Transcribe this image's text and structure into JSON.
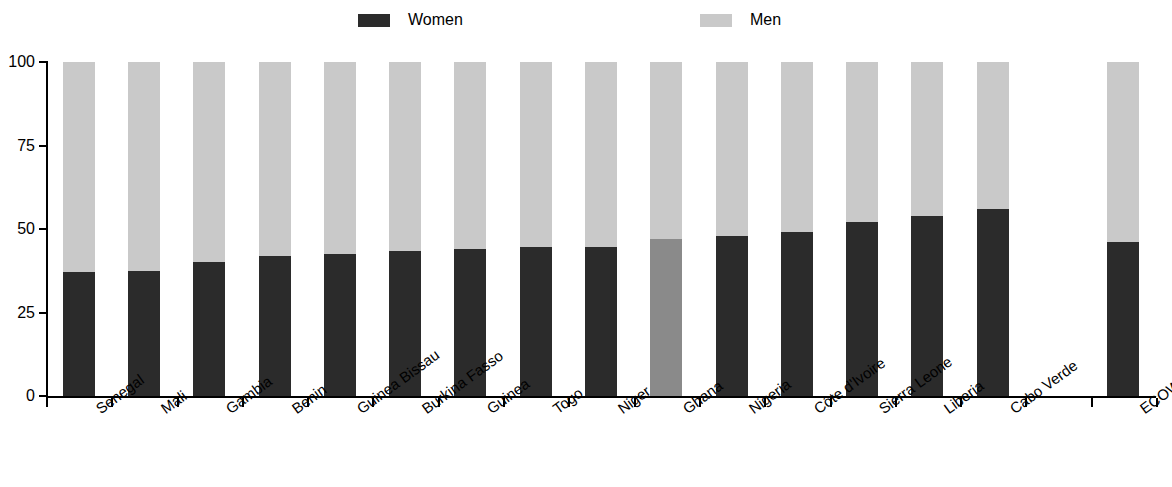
{
  "legend": {
    "items": [
      {
        "label": "Women",
        "color": "#2b2b2b"
      },
      {
        "label": "Men",
        "color": "#c9c9c9"
      }
    ]
  },
  "axis": {
    "y_ticks": [
      "0",
      "25",
      "50",
      "75",
      "100"
    ]
  },
  "chart_data": {
    "type": "bar",
    "subtype": "stacked-100-percent",
    "title": "",
    "subtitle": "",
    "xlabel": "",
    "ylabel": "",
    "ylim": [
      0,
      100
    ],
    "yticks": [
      0,
      25,
      50,
      75,
      100
    ],
    "grid": false,
    "legend_position": "top",
    "categories": [
      "Senegal",
      "Mali",
      "Gambia",
      "Benin",
      "Guinea Bissau",
      "Burkina Fasso",
      "Guinea",
      "Togo",
      "Niger",
      "Ghana",
      "Nigeria",
      "Côte d'Ivoire",
      "Sierra Leone",
      "Liberia",
      "Cabo Verde",
      "",
      "ECOWAS"
    ],
    "series": [
      {
        "name": "Women",
        "color": "#2b2b2b",
        "values": [
          37,
          37.5,
          40,
          42,
          42.5,
          43.5,
          44,
          44.5,
          44.5,
          47,
          48,
          49,
          52,
          54,
          56,
          null,
          46
        ]
      },
      {
        "name": "Men",
        "color": "#c9c9c9",
        "values": [
          63,
          62.5,
          60,
          58,
          57.5,
          56.5,
          56,
          55.5,
          55.5,
          53,
          52,
          51,
          48,
          46,
          44,
          null,
          54
        ]
      }
    ],
    "highlight": {
      "category": "Ghana",
      "women_color": "#8a8a8a",
      "note": "Ghana women segment rendered in medium grey rather than near-black"
    },
    "empty_slots": [
      15
    ]
  }
}
